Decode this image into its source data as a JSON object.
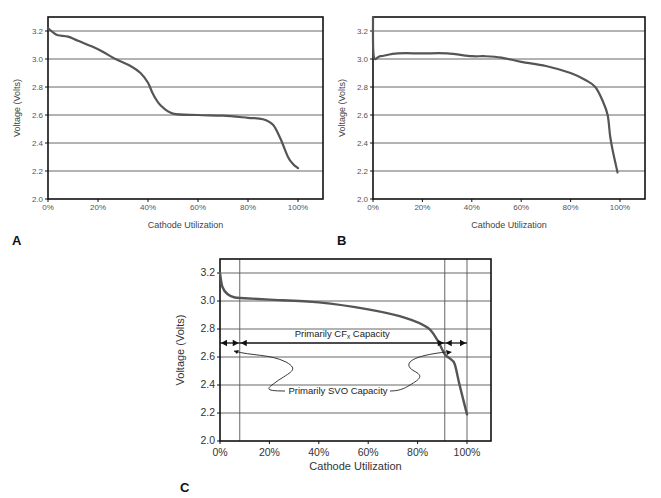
{
  "chart_data": [
    {
      "panel": "A",
      "type": "line",
      "title": "",
      "xlabel": "Cathode Utilization",
      "ylabel": "Voltage (Volts)",
      "xlim": [
        0,
        110
      ],
      "ylim": [
        2.0,
        3.3
      ],
      "x_ticks": [
        "0%",
        "20%",
        "40%",
        "60%",
        "80%",
        "100%"
      ],
      "y_ticks": [
        "2.0",
        "2.2",
        "2.4",
        "2.6",
        "2.8",
        "3.0",
        "3.2"
      ],
      "grid": "horizontal",
      "series": [
        {
          "name": "Discharge curve A",
          "x": [
            0,
            2,
            4,
            8,
            12,
            20,
            27,
            33,
            37,
            40,
            42,
            45,
            50,
            60,
            70,
            80,
            86,
            90,
            93,
            96,
            98,
            100
          ],
          "y": [
            3.22,
            3.19,
            3.17,
            3.16,
            3.13,
            3.07,
            3.0,
            2.95,
            2.9,
            2.83,
            2.75,
            2.67,
            2.61,
            2.6,
            2.595,
            2.58,
            2.57,
            2.53,
            2.43,
            2.3,
            2.25,
            2.22
          ]
        }
      ]
    },
    {
      "panel": "B",
      "type": "line",
      "title": "",
      "xlabel": "Cathode Utilization",
      "ylabel": "Voltage (Volts)",
      "xlim": [
        0,
        110
      ],
      "ylim": [
        2.0,
        3.3
      ],
      "x_ticks": [
        "0%",
        "20%",
        "40%",
        "60%",
        "80%",
        "100%"
      ],
      "y_ticks": [
        "2.0",
        "2.2",
        "2.4",
        "2.6",
        "2.8",
        "3.0",
        "3.2"
      ],
      "grid": "horizontal",
      "series": [
        {
          "name": "Discharge curve B",
          "x": [
            0,
            0.3,
            3,
            10,
            20,
            30,
            40,
            45,
            52,
            60,
            70,
            80,
            86,
            90,
            93,
            95,
            96,
            97,
            99
          ],
          "y": [
            3.3,
            3.02,
            3.02,
            3.04,
            3.04,
            3.04,
            3.02,
            3.02,
            3.01,
            2.98,
            2.95,
            2.9,
            2.85,
            2.8,
            2.7,
            2.6,
            2.45,
            2.35,
            2.19
          ]
        }
      ]
    },
    {
      "panel": "C",
      "type": "line",
      "title": "",
      "xlabel": "Cathode Utilization",
      "ylabel": "Voltage (Volts)",
      "xlim": [
        0,
        110
      ],
      "ylim": [
        2.0,
        3.3
      ],
      "x_ticks": [
        "0%",
        "20%",
        "40%",
        "60%",
        "80%",
        "100%"
      ],
      "y_ticks": [
        "2.0",
        "2.2",
        "2.4",
        "2.6",
        "2.8",
        "3.0",
        "3.2"
      ],
      "grid": "horizontal + vertical markers at 8%, 91%, 100%",
      "series": [
        {
          "name": "Discharge curve C",
          "x": [
            0,
            1,
            3,
            6,
            10,
            20,
            40,
            60,
            75,
            84,
            88,
            91,
            93,
            95,
            97,
            100
          ],
          "y": [
            3.2,
            3.1,
            3.05,
            3.025,
            3.02,
            3.01,
            2.99,
            2.94,
            2.88,
            2.81,
            2.72,
            2.62,
            2.59,
            2.55,
            2.4,
            2.19
          ]
        }
      ],
      "annotations": [
        {
          "text": "Primarily CFx Capacity",
          "range_pct": [
            8,
            91
          ],
          "y": 2.7
        },
        {
          "text": "Primarily SVO Capacity",
          "ranges_pct": [
            [
              0,
              8
            ],
            [
              91,
              100
            ]
          ],
          "y": 2.7
        }
      ]
    }
  ],
  "panels": {
    "A": {
      "label": "A",
      "xlabel": "Cathode Utilization",
      "ylabel": "Voltage (Volts)",
      "x_ticks": [
        "0%",
        "20%",
        "40%",
        "60%",
        "80%",
        "100%"
      ],
      "y_ticks": [
        "2.0",
        "2.2",
        "2.4",
        "2.6",
        "2.8",
        "3.0",
        "3.2"
      ]
    },
    "B": {
      "label": "B",
      "xlabel": "Cathode Utilization",
      "ylabel": "Voltage (Volts)",
      "x_ticks": [
        "0%",
        "20%",
        "40%",
        "60%",
        "80%",
        "100%"
      ],
      "y_ticks": [
        "2.0",
        "2.2",
        "2.4",
        "2.6",
        "2.8",
        "3.0",
        "3.2"
      ]
    },
    "C": {
      "label": "C",
      "xlabel": "Cathode Utilization",
      "ylabel": "Voltage (Volts)",
      "x_ticks": [
        "0%",
        "20%",
        "40%",
        "60%",
        "80%",
        "100%"
      ],
      "y_ticks": [
        "2.0",
        "2.2",
        "2.4",
        "2.6",
        "2.8",
        "3.0",
        "3.2"
      ],
      "cfx_label_main": "Primarily CF",
      "cfx_label_sub": "x",
      "cfx_label_tail": " Capacity",
      "svo_label": "Primarily SVO Capacity"
    }
  },
  "colors": {
    "curve": "#555555",
    "grid": "#444444",
    "frame": "#111111"
  }
}
